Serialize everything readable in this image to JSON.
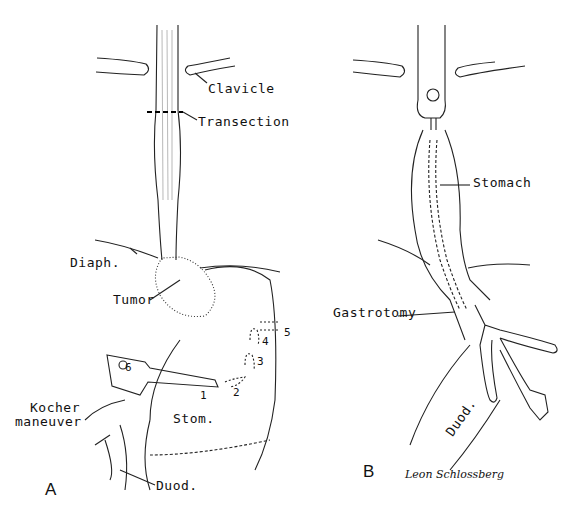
{
  "panels": {
    "a": {
      "letter": "A",
      "labels": {
        "clavicle": "Clavicle",
        "transection": "Transection",
        "diaphragm": "Diaph.",
        "tumor": "Tumor",
        "kocher": "Kocher\nmaneuver",
        "kocher_line1": "Kocher",
        "kocher_line2": "maneuver",
        "stomach": "Stom.",
        "duodenum": "Duod."
      },
      "steps": [
        "1",
        "2",
        "3",
        "4",
        "5",
        "6"
      ]
    },
    "b": {
      "letter": "B",
      "labels": {
        "stomach": "Stomach",
        "gastrotomy": "Gastrotomy",
        "duodenum": "Duod."
      }
    },
    "signature": "Leon Schlossberg"
  }
}
